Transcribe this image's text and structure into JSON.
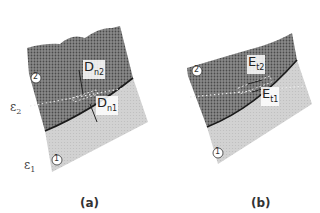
{
  "figure": {
    "panels": [
      {
        "id": "a",
        "caption": "(a)",
        "region_upper_label": "2",
        "region_lower_label": "1",
        "epsilon_upper": {
          "symbol": "ε",
          "sub": "2"
        },
        "epsilon_lower": {
          "symbol": "ε",
          "sub": "1"
        },
        "field_upper": {
          "symbol": "D",
          "sub": "n2"
        },
        "field_lower": {
          "symbol": "D",
          "sub": "n1"
        }
      },
      {
        "id": "b",
        "caption": "(b)",
        "region_upper_label": "2",
        "region_lower_label": "1",
        "field_upper": {
          "symbol": "E",
          "sub": "t2"
        },
        "field_lower": {
          "symbol": "E",
          "sub": "t1"
        }
      }
    ],
    "colors": {
      "upper_medium": "#6e6e6e",
      "lower_medium": "#cdcdcd",
      "interface": "#1a1a1a",
      "background": "#ffffff"
    }
  }
}
